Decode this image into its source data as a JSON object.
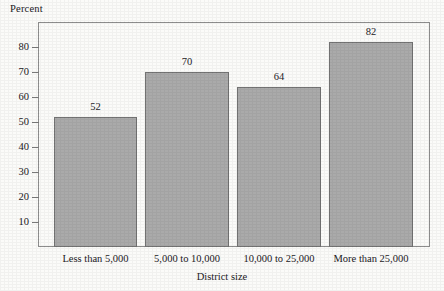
{
  "chart_data": {
    "type": "bar",
    "title": "",
    "ylabel": "Percent",
    "xlabel": "District size",
    "categories": [
      "Less than 5,000",
      "5,000 to 10,000",
      "10,000 to 25,000",
      "More than 25,000"
    ],
    "values": [
      52,
      70,
      64,
      82
    ],
    "value_labels": [
      "52",
      "70",
      "64",
      "82"
    ],
    "ylim": [
      0,
      90
    ],
    "yticks": [
      10,
      20,
      30,
      40,
      50,
      60,
      70,
      80
    ],
    "ytick_labels": [
      "10",
      "20",
      "30",
      "40",
      "50",
      "60",
      "70",
      "80"
    ],
    "grid": false,
    "legend": null,
    "legend_position": "none",
    "bar_color": "#aaaaaa",
    "bar_border_color": "#737373",
    "axis_color": "#8d8d8d",
    "background_color": "#fbfbf9",
    "text_color": "#22201e"
  }
}
